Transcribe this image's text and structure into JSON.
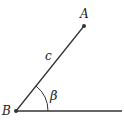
{
  "diagram": {
    "points": {
      "A": {
        "label": "A",
        "x": 84,
        "y": 26
      },
      "B": {
        "label": "B",
        "x": 16,
        "y": 111
      }
    },
    "segments": [
      {
        "from": "B",
        "to": "A",
        "label": "c"
      },
      {
        "from": "B",
        "to": "ray-end",
        "label": ""
      }
    ],
    "angle": {
      "vertex": "B",
      "label": "β"
    },
    "colors": {
      "line": "#333333",
      "text": "#222222"
    }
  }
}
